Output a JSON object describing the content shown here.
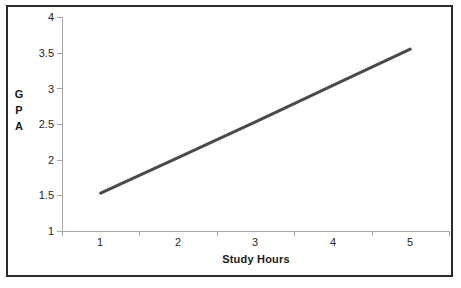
{
  "chart_data": {
    "type": "line",
    "title": "",
    "xlabel": "Study Hours",
    "ylabel": "GPA",
    "ylabel_stacked": [
      "G",
      "P",
      "A"
    ],
    "categories": [
      "1",
      "2",
      "3",
      "4",
      "5"
    ],
    "x": [
      1,
      2,
      3,
      4,
      5
    ],
    "values": [
      1.53,
      2.03,
      2.53,
      3.04,
      3.55
    ],
    "series": [
      {
        "name": "GPA",
        "values": [
          1.53,
          2.03,
          2.53,
          3.04,
          3.55
        ]
      }
    ],
    "ylim": [
      1,
      4
    ],
    "yticks": [
      1,
      1.5,
      2,
      2.5,
      3,
      3.5,
      4
    ],
    "ytick_labels": [
      "1",
      "1.5",
      "2",
      "2.5",
      "3",
      "3.5",
      "4"
    ],
    "xtick_labels": [
      "1",
      "2",
      "3",
      "4",
      "5"
    ],
    "grid": false,
    "legend": false,
    "legend_position": "none",
    "line_color": "#4a4a4a",
    "line_width": 3,
    "markers": false,
    "background_color": "#ffffff",
    "axis_color": "#a6a6a6",
    "border_color": "#2b2b2b",
    "text_color": "#262626",
    "annotation": "GPA increases linearly with study hours"
  }
}
